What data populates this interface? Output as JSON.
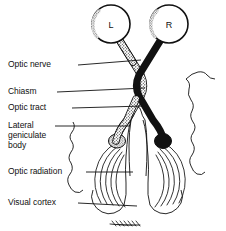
{
  "figure": {
    "background_color": "#ffffff",
    "ink_color": "#111111"
  },
  "eyes": [
    {
      "id": "left-eye",
      "label": "L",
      "cx": 111,
      "cy": 24,
      "r": 19
    },
    {
      "id": "right-eye",
      "label": "R",
      "cx": 169,
      "cy": 24,
      "r": 19
    }
  ],
  "labels": [
    {
      "id": "optic-nerve",
      "lines": [
        "Optic nerve"
      ],
      "x": 8,
      "y": 60,
      "leader_from_x": 78,
      "leader_from_y": 65,
      "leader_to_x": 141,
      "leader_to_y": 60
    },
    {
      "id": "chiasm",
      "lines": [
        "Chiasm"
      ],
      "x": 8,
      "y": 87,
      "leader_from_x": 57,
      "leader_from_y": 92,
      "leader_to_x": 145,
      "leader_to_y": 88
    },
    {
      "id": "optic-tract",
      "lines": [
        "Optic tract"
      ],
      "x": 8,
      "y": 103,
      "leader_from_x": 72,
      "leader_from_y": 108,
      "leader_to_x": 144,
      "leader_to_y": 106
    },
    {
      "id": "lateral-geniculate-body",
      "lines": [
        "Lateral",
        "geniculate",
        "body"
      ],
      "x": 8,
      "y": 121,
      "leader_from_x": 55,
      "leader_from_y": 126,
      "leader_to_x": 130,
      "leader_to_y": 126
    },
    {
      "id": "optic-radiation",
      "lines": [
        "Optic radiation"
      ],
      "x": 8,
      "y": 167,
      "leader_from_x": 86,
      "leader_from_y": 172,
      "leader_to_x": 133,
      "leader_to_y": 172
    },
    {
      "id": "visual-cortex",
      "lines": [
        "Visual cortex"
      ],
      "x": 8,
      "y": 198,
      "leader_from_x": 78,
      "leader_from_y": 203,
      "leader_to_x": 137,
      "leader_to_y": 206
    }
  ],
  "pathways": {
    "left_eye_fiber_style": "stippled",
    "right_eye_fiber_style": "solid-black",
    "crossing_point": {
      "x": 140,
      "y": 89
    },
    "description": "Left eye fibers (stippled) cross at chiasm to right tract; right eye fibers (black) cross to left tract."
  },
  "radiation": {
    "left_fan_fiber_count": 5,
    "right_fan_fiber_count": 5
  }
}
